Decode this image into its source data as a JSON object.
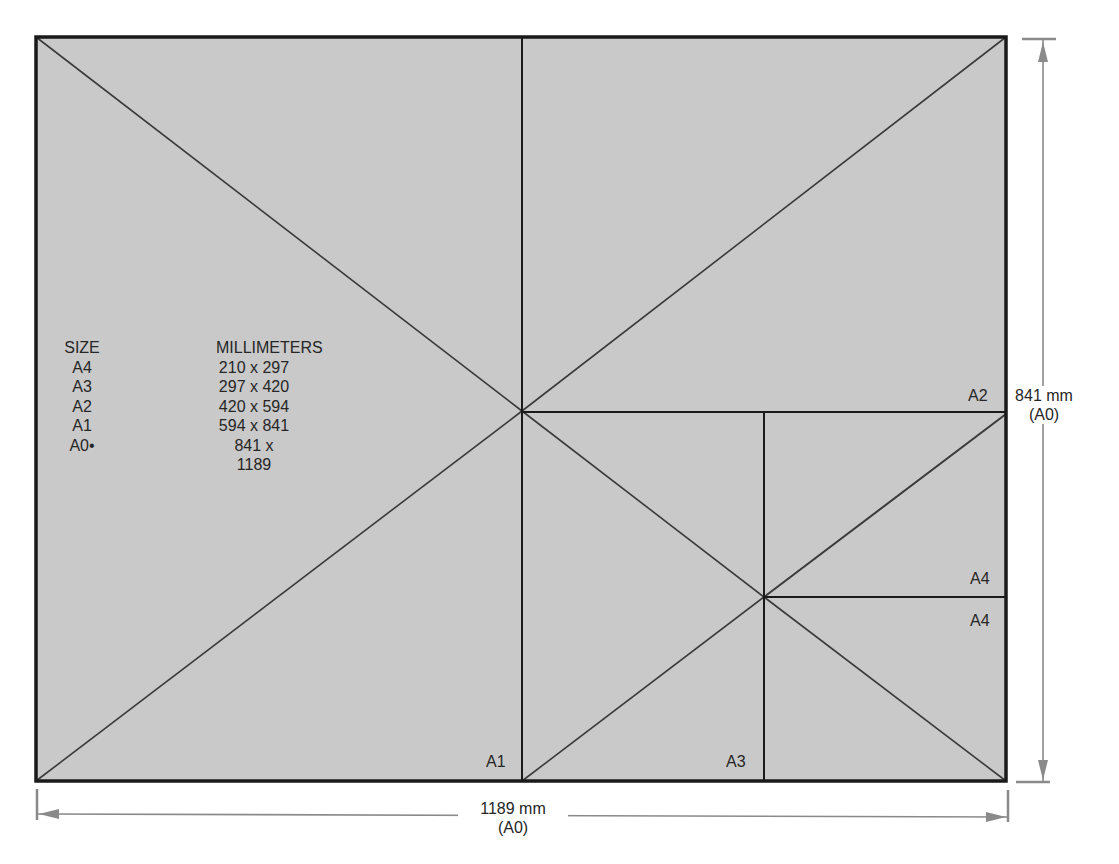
{
  "diagram": {
    "colors": {
      "sheet_fill": "#c9c9c9",
      "frame": "#1a1a1a",
      "dimension_line": "#8a8a8a",
      "text": "#262626"
    },
    "table": {
      "header": {
        "size": "SIZE",
        "millimeters": "MILLIMETERS"
      },
      "rows": [
        {
          "size": "A4",
          "mm": "210 x 297"
        },
        {
          "size": "A3",
          "mm": "297 x 420"
        },
        {
          "size": "A2",
          "mm": "420 x 594"
        },
        {
          "size": "A1",
          "mm": "594 x 841"
        },
        {
          "size": "A0•",
          "mm": "841 x 1189"
        }
      ]
    },
    "region_labels": {
      "a1": "A1",
      "a2": "A2",
      "a3": "A3",
      "a4_top": "A4",
      "a4_bottom": "A4"
    },
    "dimensions": {
      "height": {
        "value": "841 mm",
        "note": "(A0)"
      },
      "width": {
        "value": "1189 mm",
        "note": "(A0)"
      }
    }
  }
}
